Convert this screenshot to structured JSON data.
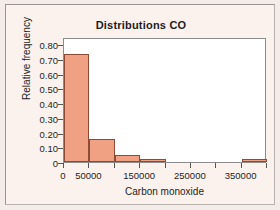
{
  "figure": {
    "background_color": "#fbf1ed",
    "frame_color": "#9a9592",
    "plot_background": "#ffffff"
  },
  "chart_data": {
    "type": "bar",
    "title": "Distributions CO",
    "xlabel": "Carbon monoxide",
    "ylabel": "Relative frequency",
    "subtitle": "",
    "grid": false,
    "legend": null,
    "bar_fill_color": "#f0a183",
    "bar_edge_color": "#8f4a36",
    "bin_width": 50000,
    "xlim": [
      0,
      400000
    ],
    "ylim": [
      0,
      0.85
    ],
    "xticks": [
      0,
      50000,
      100000,
      150000,
      200000,
      250000,
      300000,
      350000,
      400000
    ],
    "xtick_labels": [
      "0",
      "50000",
      "",
      "150000",
      "",
      "250000",
      "",
      "350000",
      ""
    ],
    "yticks": [
      0,
      0.1,
      0.2,
      0.3,
      0.4,
      0.5,
      0.6,
      0.7,
      0.8
    ],
    "ytick_labels": [
      "0",
      "0.10",
      "0.20",
      "0.30",
      "0.40",
      "0.50",
      "0.60",
      "0.70",
      "0.80"
    ],
    "bins": [
      {
        "left": 0,
        "right": 50000,
        "value": 0.735
      },
      {
        "left": 50000,
        "right": 100000,
        "value": 0.155
      },
      {
        "left": 100000,
        "right": 150000,
        "value": 0.045
      },
      {
        "left": 150000,
        "right": 200000,
        "value": 0.018
      },
      {
        "left": 200000,
        "right": 250000,
        "value": 0
      },
      {
        "left": 250000,
        "right": 300000,
        "value": 0
      },
      {
        "left": 300000,
        "right": 350000,
        "value": 0
      },
      {
        "left": 350000,
        "right": 400000,
        "value": 0.022
      }
    ],
    "categories": [
      "0-50000",
      "50000-100000",
      "100000-150000",
      "150000-200000",
      "200000-250000",
      "250000-300000",
      "300000-350000",
      "350000-400000"
    ],
    "values": [
      0.735,
      0.155,
      0.045,
      0.018,
      0,
      0,
      0,
      0.022
    ]
  }
}
